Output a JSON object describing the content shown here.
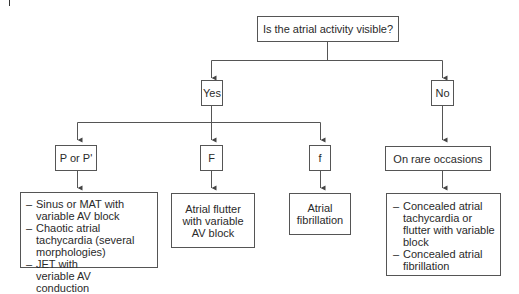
{
  "diagram": {
    "root": {
      "label": "Is the atrial activity visible?"
    },
    "branches": {
      "yes": {
        "label": "Yes"
      },
      "no": {
        "label": "No"
      }
    },
    "yes_children": [
      {
        "label": "P or P'",
        "result_lines": [
          "Sinus or MAT with variable AV block",
          "Chaotic atrial tachycardia (several morphologies)",
          "JET with veriable AV conduction"
        ]
      },
      {
        "label": "F",
        "result": "Atrial flutter with variable AV block"
      },
      {
        "label": "f",
        "result": "Atrial fibrillation"
      }
    ],
    "no_child": {
      "label": "On rare occasions",
      "result_lines": [
        "Concealed atrial tachycardia or flutter with variable block",
        "Concealed atrial fibrillation"
      ]
    },
    "colors": {
      "line": "#555555",
      "text": "#2a2a2a",
      "background": "#ffffff"
    }
  }
}
